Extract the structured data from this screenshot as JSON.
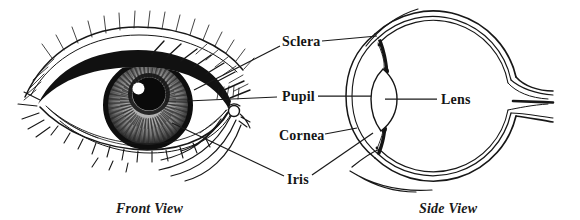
{
  "figure": {
    "background_color": "#ffffff",
    "ink_color": "#171717",
    "labels": {
      "sclera": "Sclera",
      "pupil": "Pupil",
      "cornea": "Cornea",
      "iris": "Iris",
      "lens": "Lens"
    },
    "captions": {
      "front_view": "Front View",
      "side_view": "Side View"
    }
  }
}
